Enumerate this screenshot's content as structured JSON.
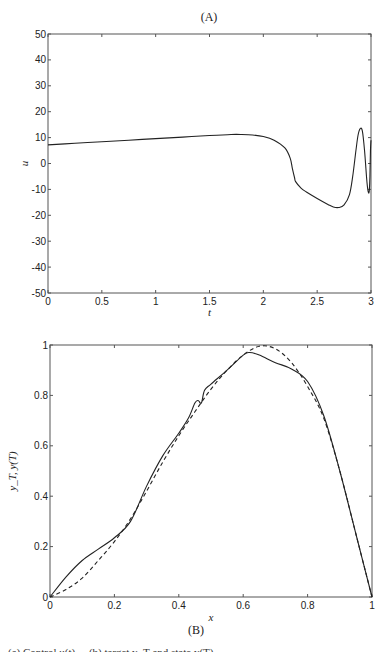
{
  "figure": {
    "panel_a_label": "(A)",
    "panel_b_label": "(B)",
    "caption_fragment": "(a) Control u(t) ... (b) target y_T and state y(T)"
  },
  "chart_data": [
    {
      "type": "line",
      "title": "(A)",
      "xlabel": "t",
      "ylabel": "u",
      "xlim": [
        0,
        3
      ],
      "ylim": [
        -50,
        50
      ],
      "xticks": [
        0,
        0.5,
        1,
        1.5,
        2,
        2.5,
        3
      ],
      "xtick_labels": [
        "0",
        "0.5",
        "1",
        "1.5",
        "2",
        "2.5",
        "3"
      ],
      "yticks": [
        -50,
        -40,
        -30,
        -20,
        -10,
        0,
        10,
        20,
        30,
        40,
        50
      ],
      "ytick_labels": [
        "-50",
        "-40",
        "-30",
        "-20",
        "-10",
        "0",
        "10",
        "20",
        "30",
        "40",
        "50"
      ],
      "grid": false,
      "series": [
        {
          "name": "u(t)",
          "style": "solid",
          "x": [
            0,
            0.25,
            0.5,
            0.75,
            1.0,
            1.25,
            1.5,
            1.7,
            1.8,
            1.9,
            2.0,
            2.1,
            2.2,
            2.25,
            2.27,
            2.29,
            2.3,
            2.35,
            2.4,
            2.5,
            2.6,
            2.65,
            2.7,
            2.75,
            2.8,
            2.83,
            2.86,
            2.88,
            2.9,
            2.92,
            2.94,
            2.96,
            2.97,
            2.98,
            2.985,
            2.99,
            2.995,
            3.0
          ],
          "y": [
            7.2,
            7.8,
            8.4,
            9.0,
            9.6,
            10.2,
            10.8,
            11.2,
            11.2,
            11.0,
            10.4,
            9.0,
            6.0,
            2.0,
            -2.0,
            -5.5,
            -7.0,
            -9.5,
            -11.0,
            -13.5,
            -15.8,
            -16.8,
            -17.0,
            -16.0,
            -12.0,
            -5.0,
            5.0,
            11.0,
            13.5,
            12.5,
            5.0,
            -6.0,
            -10.0,
            -11.5,
            -10.0,
            -5.0,
            5.0,
            9.0
          ]
        }
      ]
    },
    {
      "type": "line",
      "title": "(B)",
      "xlabel": "x",
      "ylabel": "y_T, y(T)",
      "xlim": [
        0,
        1
      ],
      "ylim": [
        0,
        1
      ],
      "xticks": [
        0,
        0.2,
        0.4,
        0.6,
        0.8,
        1
      ],
      "xtick_labels": [
        "0",
        "0.2",
        "0.4",
        "0.6",
        "0.8",
        "1"
      ],
      "yticks": [
        0,
        0.2,
        0.4,
        0.6,
        0.8,
        1
      ],
      "ytick_labels": [
        "0",
        "0.2",
        "0.4",
        "0.6",
        "0.8",
        "1"
      ],
      "grid": false,
      "series": [
        {
          "name": "y(T)",
          "style": "solid",
          "x": [
            0,
            0.05,
            0.1,
            0.15,
            0.2,
            0.25,
            0.3,
            0.35,
            0.4,
            0.43,
            0.45,
            0.46,
            0.47,
            0.48,
            0.5,
            0.55,
            0.6,
            0.62,
            0.65,
            0.7,
            0.75,
            0.8,
            0.85,
            0.9,
            0.95,
            1.0
          ],
          "y": [
            0,
            0.08,
            0.145,
            0.19,
            0.235,
            0.3,
            0.44,
            0.56,
            0.65,
            0.71,
            0.77,
            0.78,
            0.77,
            0.82,
            0.845,
            0.9,
            0.96,
            0.97,
            0.96,
            0.93,
            0.905,
            0.855,
            0.72,
            0.5,
            0.25,
            0
          ]
        },
        {
          "name": "y_T",
          "style": "dashed",
          "x": [
            0,
            0.05,
            0.1,
            0.15,
            0.2,
            0.25,
            0.3,
            0.35,
            0.4,
            0.45,
            0.5,
            0.55,
            0.6,
            0.65,
            0.7,
            0.75,
            0.8,
            0.85,
            0.9,
            0.95,
            1.0
          ],
          "y": [
            0,
            0.03,
            0.075,
            0.145,
            0.22,
            0.31,
            0.42,
            0.535,
            0.64,
            0.735,
            0.825,
            0.9,
            0.96,
            0.995,
            0.985,
            0.93,
            0.835,
            0.71,
            0.5,
            0.25,
            0
          ]
        }
      ]
    }
  ]
}
